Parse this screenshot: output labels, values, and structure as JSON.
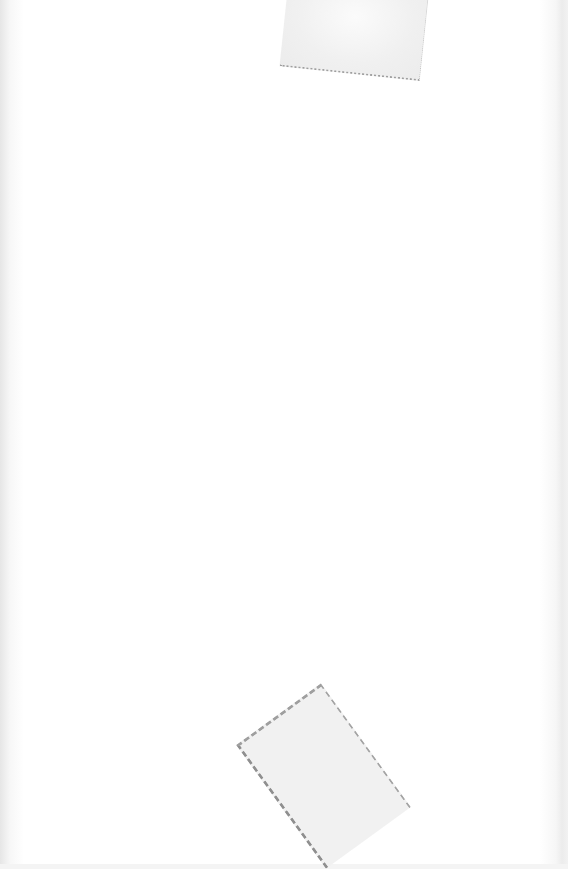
{
  "document": {
    "type": "blank scanned page",
    "text": "",
    "marks": [
      {
        "name": "tape-residue-top"
      },
      {
        "name": "tape-residue-bottom"
      }
    ]
  }
}
